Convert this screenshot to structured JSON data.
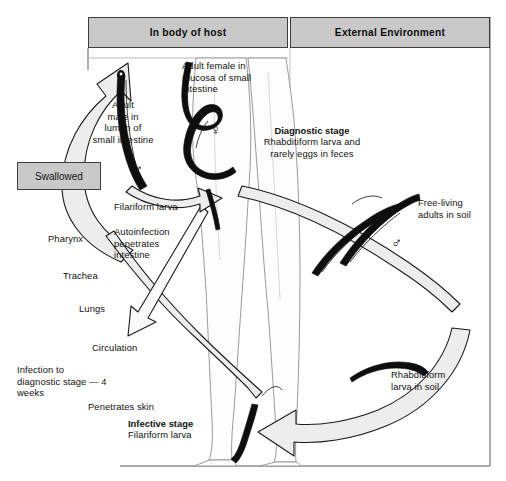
{
  "diagram": {
    "colors": {
      "box_fill": "#c9c9c9",
      "box_border": "#3d3d3d",
      "arrow_fill": "#ececec",
      "arrow_stroke": "#1a1a1a",
      "worm": "#101010",
      "background": "#ffffff"
    },
    "headers": [
      {
        "label": "In body of host"
      },
      {
        "label": "External Environment"
      }
    ],
    "callouts": [
      {
        "label": "Swallowed"
      }
    ],
    "labels": {
      "adult_female": "Adult female in\nmucosa of small\nintestine",
      "adult_male": "Adult\nmale in\nlumen of\nsmall intestine",
      "filariform_larva": "Filariform larva",
      "autoinfection": "Autoinfection\npenetrates\nintestine",
      "pharynx": "Pharynx",
      "trachea": "Trachea",
      "lungs": "Lungs",
      "circulation": "Circulation",
      "infection_time": "Infection to\ndiagnostic stage — 4\nweeks",
      "penetrates_skin": "Penetrates skin",
      "free_living": "Free-living\nadults in soil",
      "rhabditiform_soil": "Rhabditiform\nlarva in soil"
    },
    "stages": [
      {
        "name": "diagnostic-stage",
        "title": "Diagnostic stage",
        "detail": "Rhabditiform larva and\nrarely eggs in feces"
      },
      {
        "name": "infective-stage",
        "title": "Infective stage",
        "detail": "Filariform larva"
      }
    ],
    "symbols": {
      "female": "♀",
      "male": "♂"
    }
  }
}
